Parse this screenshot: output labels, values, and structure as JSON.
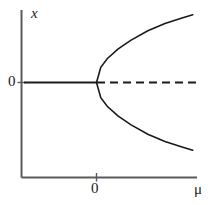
{
  "figure": {
    "background_color": "#ffffff",
    "line_color": "#1a1a1a",
    "axis_color": "#4a4a4a"
  },
  "labels": {
    "y_axis_label": "x",
    "x_axis_label": "μ",
    "y_tick_zero": "0",
    "x_tick_zero": "0"
  },
  "chart_data": {
    "type": "line",
    "xlabel": "μ",
    "ylabel": "x",
    "xlim": [
      -1.2,
      2.35
    ],
    "ylim": [
      -1.55,
      1.55
    ],
    "grid": false,
    "legend": false,
    "axis_origin": {
      "x": 0,
      "y": 0
    },
    "x_ticks": [
      {
        "value": 0,
        "label": "0"
      }
    ],
    "y_ticks": [
      {
        "value": 0,
        "label": "0"
      }
    ],
    "bifurcation_point": {
      "mu": 0,
      "x": 0
    },
    "series": [
      {
        "name": "stable-branch-negative-mu",
        "style": "solid",
        "description": "x = 0 stable for mu < 0",
        "points": [
          {
            "mu": -1.2,
            "x": 0
          },
          {
            "mu": 0,
            "x": 0
          }
        ]
      },
      {
        "name": "unstable-branch-positive-mu",
        "style": "dashed",
        "description": "x = 0 unstable for mu > 0",
        "points": [
          {
            "mu": 0,
            "x": 0
          },
          {
            "mu": 2.35,
            "x": 0
          }
        ]
      },
      {
        "name": "upper-stable-branch",
        "style": "solid",
        "description": "x = +sqrt(mu) for mu > 0",
        "points": [
          {
            "mu": 0.0,
            "x": 0.0
          },
          {
            "mu": 0.1,
            "x": 0.33
          },
          {
            "mu": 0.25,
            "x": 0.52
          },
          {
            "mu": 0.5,
            "x": 0.73
          },
          {
            "mu": 0.8,
            "x": 0.92
          },
          {
            "mu": 1.2,
            "x": 1.13
          },
          {
            "mu": 1.6,
            "x": 1.29
          },
          {
            "mu": 2.0,
            "x": 1.41
          },
          {
            "mu": 2.25,
            "x": 1.48
          }
        ]
      },
      {
        "name": "lower-stable-branch",
        "style": "solid",
        "description": "x = -sqrt(mu) for mu > 0",
        "points": [
          {
            "mu": 0.0,
            "x": 0.0
          },
          {
            "mu": 0.1,
            "x": -0.33
          },
          {
            "mu": 0.25,
            "x": -0.52
          },
          {
            "mu": 0.5,
            "x": -0.73
          },
          {
            "mu": 0.8,
            "x": -0.92
          },
          {
            "mu": 1.2,
            "x": -1.13
          },
          {
            "mu": 1.6,
            "x": -1.29
          },
          {
            "mu": 2.0,
            "x": -1.41
          },
          {
            "mu": 2.25,
            "x": -1.48
          }
        ]
      }
    ]
  }
}
